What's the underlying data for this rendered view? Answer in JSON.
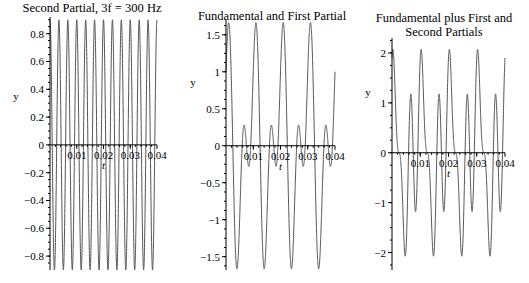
{
  "chart_data": [
    {
      "type": "line",
      "title": [
        "Second Partial, 3f = 300 Hz"
      ],
      "xlabel": "t",
      "ylabel": "y",
      "xlim": [
        0,
        0.04
      ],
      "ylim": [
        -0.9,
        0.92
      ],
      "xticks": [
        0.01,
        0.02,
        0.03,
        0.04
      ],
      "xtick_labels": [
        "0.01",
        "0.02",
        "0.03",
        "0.04"
      ],
      "yticks": [
        -0.8,
        -0.6,
        -0.4,
        -0.2,
        0,
        0.2,
        0.4,
        0.6,
        0.8
      ],
      "ytick_labels": [
        "-0.8",
        "-0.6",
        "-0.4",
        "-0.2",
        "0",
        "0.2",
        "0.4",
        "0.6",
        "0.8"
      ],
      "series": [
        {
          "name": "y",
          "components": [
            {
              "freq_hz": 300,
              "amplitude": 0.9
            }
          ]
        }
      ]
    },
    {
      "type": "line",
      "title": [
        "Fundamental and First Partial"
      ],
      "xlabel": "t",
      "ylabel": "y",
      "xlim": [
        0,
        0.04
      ],
      "ylim": [
        -1.68,
        1.7
      ],
      "xticks": [
        0.01,
        0.02,
        0.03,
        0.04
      ],
      "xtick_labels": [
        "0.01",
        "0.02",
        "0.03",
        "0.04"
      ],
      "yticks": [
        -1.5,
        -1,
        -0.5,
        0,
        0.5,
        1,
        1.5
      ],
      "ytick_labels": [
        "-1.5",
        "-1",
        "-0.5",
        "0",
        "0.5",
        "1",
        "1.5"
      ],
      "series": [
        {
          "name": "y",
          "components": [
            {
              "freq_hz": 100,
              "amplitude": 1
            },
            {
              "freq_hz": 200,
              "amplitude": 0.9
            }
          ]
        }
      ]
    },
    {
      "type": "line",
      "title": [
        "Fundamental plus First and",
        "Second Partials"
      ],
      "xlabel": "t",
      "ylabel": "y",
      "xlim": [
        0,
        0.04
      ],
      "ylim": [
        -2.35,
        2.3
      ],
      "xticks": [
        0.01,
        0.02,
        0.03,
        0.04
      ],
      "xtick_labels": [
        "0.01",
        "0.02",
        "0.03",
        "0.04"
      ],
      "yticks": [
        -2,
        -1,
        0,
        1,
        2
      ],
      "ytick_labels": [
        "-2",
        "-1",
        "0",
        "1",
        "2"
      ],
      "series": [
        {
          "name": "y",
          "components": [
            {
              "freq_hz": 100,
              "amplitude": 1
            },
            {
              "freq_hz": 200,
              "amplitude": 0.9
            },
            {
              "freq_hz": 300,
              "amplitude": 0.9
            }
          ]
        }
      ]
    }
  ]
}
